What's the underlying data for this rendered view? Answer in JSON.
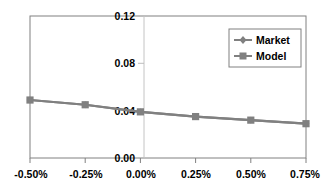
{
  "chart_data": {
    "type": "line",
    "title": "",
    "subtitle": "",
    "xlabel": "",
    "ylabel": "",
    "x": [
      -0.5,
      -0.25,
      0.0,
      0.25,
      0.5,
      0.75
    ],
    "x_tick_labels": [
      "-0.50%",
      "-0.25%",
      "0.00%",
      "0.25%",
      "0.50%",
      "0.75%"
    ],
    "y_tick_labels": [
      "0.00",
      "0.04",
      "0.08",
      "0.12"
    ],
    "y_ticks": [
      0.0,
      0.04,
      0.08,
      0.12
    ],
    "xlim": [
      -0.5,
      0.75
    ],
    "ylim": [
      0.0,
      0.12
    ],
    "grid": false,
    "legend_position": "top-right",
    "series": [
      {
        "name": "Market",
        "marker": "diamond",
        "color": "#808080",
        "values": [
          0.049,
          0.045,
          0.039,
          0.035,
          0.032,
          0.029
        ]
      },
      {
        "name": "Model",
        "marker": "square",
        "color": "#808080",
        "values": [
          0.049,
          0.045,
          0.039,
          0.035,
          0.032,
          0.029
        ]
      }
    ]
  },
  "legend": {
    "entries": [
      {
        "label": "Market",
        "marker": "diamond"
      },
      {
        "label": "Model",
        "marker": "square"
      }
    ]
  },
  "colors": {
    "line": "#808080",
    "marker": "#808080",
    "axis": "#808080",
    "vertical_axis": "#bfbfbf",
    "text": "#000000",
    "background": "#ffffff"
  }
}
